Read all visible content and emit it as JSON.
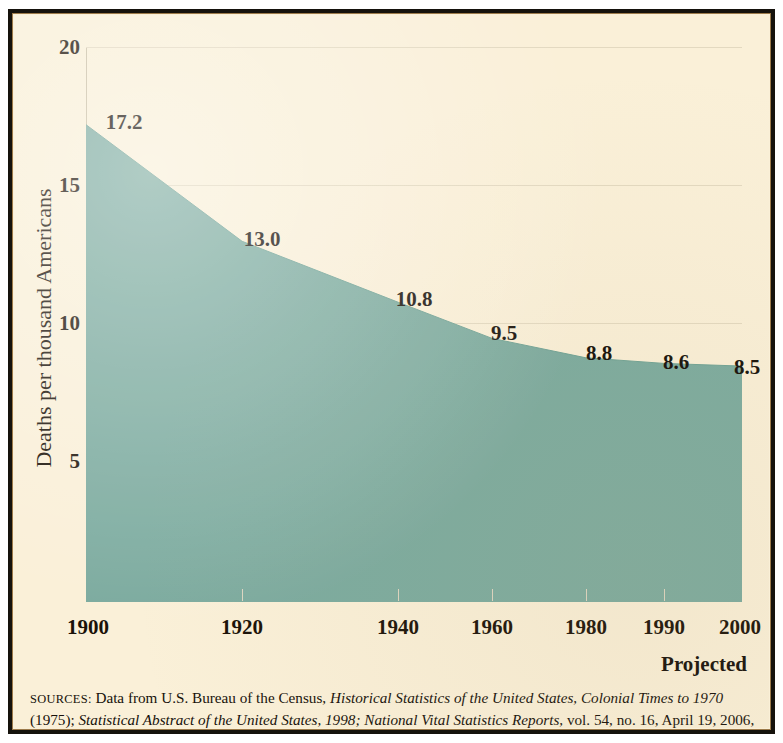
{
  "figure": {
    "yaxis_title": "Deaths per thousand Americans",
    "projected_note": "Projected",
    "sources_label": "SOURCES:",
    "sources_line1_plain1": "Data from U.S. Bureau of the Census,",
    "sources_line1_italic1": "Historical Statistics of the United States, Colonial Times to 1970",
    "sources_line1_plain2": "(1975);",
    "sources_line2_italic1": "Statistical Abstract of the United States, 1998;",
    "sources_line2_italic2": "National Vital Statistics Reports,",
    "sources_line2_plain1": "vol. 54, no. 16, April 19, 2006, table 1."
  },
  "colors": {
    "area_fill": "#7cab9f",
    "paper": "#faf0d8",
    "frame_dark": "#15120c",
    "frame_rule": "#9c7a4a",
    "gridline": "#e3d9c0",
    "text": "#16100a"
  },
  "chart_data": {
    "type": "area",
    "title": "",
    "subtitle": "",
    "xlabel": "",
    "ylabel": "Deaths per thousand Americans",
    "x": [
      1900,
      1920,
      1940,
      1960,
      1980,
      1990,
      2000
    ],
    "categories": [
      "1900",
      "1920",
      "1940",
      "1960",
      "1980",
      "1990",
      "2000"
    ],
    "values": [
      17.2,
      13.0,
      10.8,
      9.5,
      8.8,
      8.6,
      8.5
    ],
    "point_labels": [
      "17.2",
      "13.0",
      "10.8",
      "9.5",
      "8.8",
      "8.6",
      "8.5"
    ],
    "ytick_labels": [
      "20",
      "15",
      "10",
      "5"
    ],
    "yticks": [
      20,
      15,
      10,
      5
    ],
    "ylim": [
      0,
      20
    ],
    "xlim": [
      1900,
      2000
    ],
    "x_positions_fraction": [
      0,
      0.238,
      0.476,
      0.619,
      0.762,
      0.881,
      1.0
    ],
    "grid": true,
    "legend": "none",
    "annotations": [
      "Projected"
    ],
    "series": [
      {
        "name": "Deaths per thousand Americans",
        "values": [
          17.2,
          13.0,
          10.8,
          9.5,
          8.8,
          8.6,
          8.5
        ]
      }
    ]
  }
}
